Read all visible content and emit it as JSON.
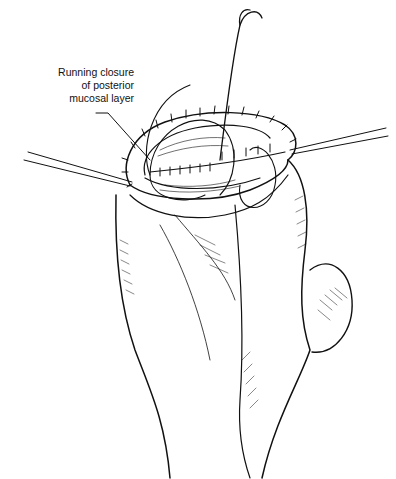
{
  "figure": {
    "label_lines": [
      "Running closure",
      "of posterior",
      "mucosal layer"
    ],
    "colors": {
      "ink": "#111111",
      "background": "#ffffff"
    }
  }
}
